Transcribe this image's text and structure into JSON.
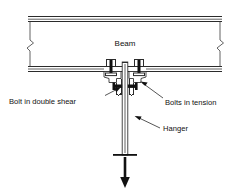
{
  "figure": {
    "background_color": "#ffffff",
    "line_color": "#2b2b2b",
    "text_color": "#111111",
    "width": 250,
    "height": 194
  },
  "labels": {
    "beam": "Beam",
    "bolt_double_shear": "Bolt in double shear",
    "bolts_in_tension": "Bolts in tension",
    "hanger": "Hanger"
  },
  "components": {
    "beam_top_flange": "beam-top-flange",
    "beam_bottom_flange": "beam-bottom-flange",
    "break_symbol_left": "break-symbol-left",
    "break_symbol_right": "break-symbol-right",
    "tee_hanger_bracket": "tee-hanger-bracket",
    "tension_bolt_left": "tension-bolt-left",
    "tension_bolt_right": "tension-bolt-right",
    "shear_bolt": "shear-bolt",
    "hanger_rod": "hanger-rod",
    "load_arrow": "load-arrow"
  }
}
